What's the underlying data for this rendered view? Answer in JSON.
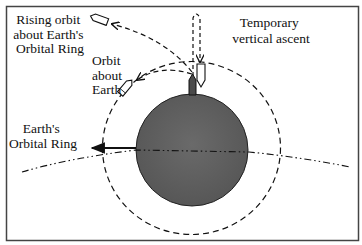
{
  "diagram": {
    "labels": {
      "rising_orbit": [
        "Rising orbit",
        "about Earth's",
        "Orbital Ring"
      ],
      "temporary_ascent": [
        "Temporary",
        "vertical ascent"
      ],
      "orbit_about_earth": [
        "Orbit",
        "about",
        "Earth"
      ],
      "orbital_ring": [
        "Earth's",
        "Orbital Ring"
      ]
    },
    "elements": {
      "earth": "Earth (filled gray circle)",
      "orbit_circle": "Dashed orbit around Earth",
      "orbital_ring_line": "Dash-dot line representing Earth's Orbital Ring",
      "rocket_on_surface": "Dark rocket on Earth's surface",
      "rocket_descending": "White rocket after vertical ascent",
      "rocket_in_earth_orbit": "Rocket in orbit about Earth",
      "rocket_rising_orbit": "Rocket in rising orbit"
    },
    "colors": {
      "earth_fill": "#5e5e5e",
      "stroke": "#111111",
      "frame": "#444444",
      "background": "#ffffff"
    }
  }
}
